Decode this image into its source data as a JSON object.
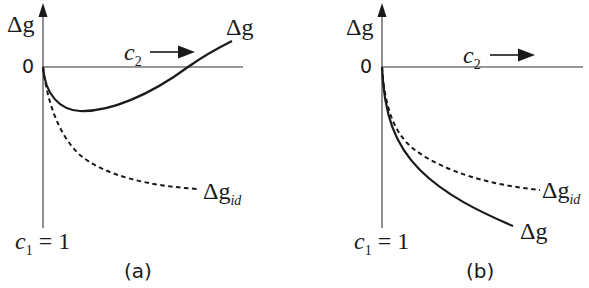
{
  "figure": {
    "panels": [
      {
        "id": "a",
        "caption": "(a)",
        "y_axis_label": "Δg",
        "origin_label": "0",
        "x_axis_label": "c",
        "x_axis_label_sub": "2",
        "x_axis_direction": "→",
        "bottom_label_var": "c",
        "bottom_label_sub": "1",
        "bottom_label_rest": " = 1",
        "curves": [
          {
            "name": "Δg",
            "label": "Δg",
            "style": "solid",
            "shape": "dips below zero to a minimum, then rises and crosses zero, becoming positive"
          },
          {
            "name": "Δg_id",
            "label": "Δg",
            "label_sub": "id",
            "style": "dashed",
            "shape": "monotonically decreasing, concave up, stays negative"
          }
        ]
      },
      {
        "id": "b",
        "caption": "(b)",
        "y_axis_label": "Δg",
        "origin_label": "0",
        "x_axis_label": "c",
        "x_axis_label_sub": "2",
        "x_axis_direction": "→",
        "bottom_label_var": "c",
        "bottom_label_sub": "1",
        "bottom_label_rest": " = 1",
        "curves": [
          {
            "name": "Δg_id",
            "label": "Δg",
            "label_sub": "id",
            "style": "dashed",
            "shape": "monotonically decreasing, concave up, stays negative"
          },
          {
            "name": "Δg",
            "label": "Δg",
            "style": "solid",
            "shape": "monotonically decreasing, below Δg_id, more negative"
          }
        ]
      }
    ],
    "colors": {
      "ink": "#1a1a1a",
      "axis": "#333333",
      "background": "#ffffff"
    }
  }
}
